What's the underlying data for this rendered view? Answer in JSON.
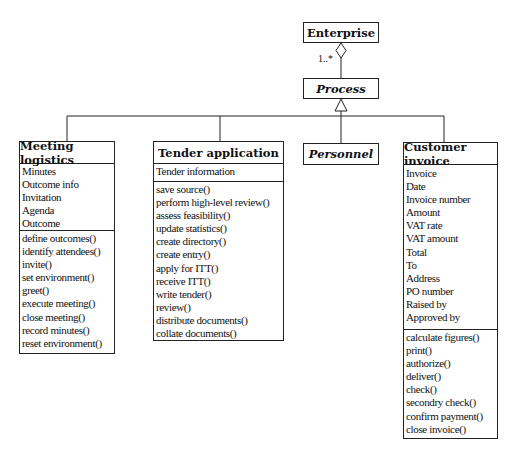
{
  "diagram": {
    "type": "UML class diagram",
    "enterprise": {
      "name": "Enterprise"
    },
    "aggregation": {
      "multiplicity": "1..*"
    },
    "process": {
      "name": "Process",
      "abstract": true
    },
    "classes": [
      {
        "name": "Meeting logistics",
        "attributes": [
          "Minutes",
          "Outcome info",
          "Invitation",
          "Agenda",
          "Outcome"
        ],
        "operations": [
          "define outcomes()",
          "identify attendees()",
          "invite()",
          "set environment()",
          "greet()",
          "execute meeting()",
          "close meeting()",
          "record minutes()",
          "reset environment()"
        ]
      },
      {
        "name": "Tender application",
        "attributes": [
          "Tender information"
        ],
        "operations": [
          "save source()",
          "perform high-level review()",
          "assess feasibility()",
          "update statistics()",
          "create directory()",
          "create entry()",
          "apply for ITT()",
          "receive ITT()",
          "write tender()",
          "review()",
          "distribute documents()",
          "collate documents()"
        ]
      },
      {
        "name": "Personnel",
        "abstract": true,
        "attributes": [],
        "operations": []
      },
      {
        "name": "Customer invoice",
        "attributes": [
          "Invoice",
          "Date",
          "Invoice number",
          "Amount",
          "VAT rate",
          "VAT amount",
          "Total",
          "To",
          "Address",
          "PO number",
          "Raised by",
          "Approved by"
        ],
        "operations": [
          "calculate figures()",
          "print()",
          "authorize()",
          "deliver()",
          "check()",
          "secondry check()",
          "confirm payment()",
          "close invoice()"
        ]
      }
    ],
    "colors": {
      "line": "#222222",
      "background": "#ffffff"
    }
  }
}
